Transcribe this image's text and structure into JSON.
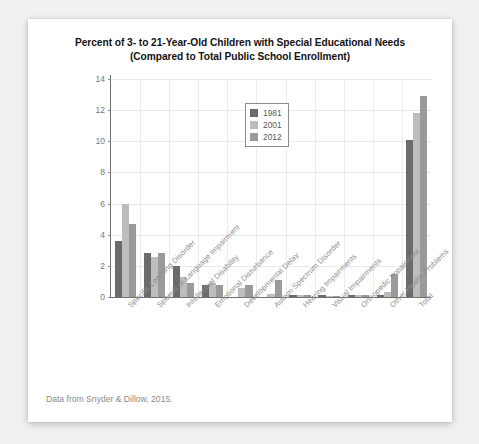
{
  "card": {
    "title_line1": "Percent of 3- to 21-Year-Old Children with Special Educational Needs",
    "title_line2": "(Compared to Total Public School Enrollment)",
    "caption": "Data from Snyder & Dillow, 2015."
  },
  "legend": {
    "items": [
      {
        "label": "1981",
        "color": "#6b6b6b"
      },
      {
        "label": "2001",
        "color": "#bdbdbd"
      },
      {
        "label": "2012",
        "color": "#9a9a9a"
      }
    ]
  },
  "chart_data": {
    "type": "bar",
    "title": "Percent of 3- to 21-Year-Old Children with Special Educational Needs (Compared to Total Public School Enrollment)",
    "xlabel": "",
    "ylabel": "",
    "ylim": [
      0,
      14
    ],
    "yticks": [
      0,
      2,
      4,
      6,
      8,
      10,
      12,
      14
    ],
    "ytick_labels": [
      "0",
      "2",
      "4",
      "6",
      "8",
      "10",
      "12",
      "14"
    ],
    "grid": true,
    "legend_position": "upper center",
    "source": "Data from Snyder & Dillow, 2015.",
    "categories": [
      "Specific Learning Disorder",
      "Speech or Language Impairment",
      "Intellectual Disability",
      "Emotional Disturbance",
      "Developmental Delay",
      "Autism Spectrum Disorder",
      "Hearing Impairments",
      "Visual Impairments",
      "Orthopedic Impairment",
      "Other Health Problems",
      "Total"
    ],
    "series": [
      {
        "name": "1981",
        "color": "#6b6b6b",
        "values": [
          3.6,
          2.8,
          2.0,
          0.8,
          0.0,
          0.0,
          0.1,
          0.1,
          0.1,
          0.1,
          10.1
        ]
      },
      {
        "name": "2001",
        "color": "#bdbdbd",
        "values": [
          6.0,
          2.6,
          1.3,
          0.9,
          0.6,
          0.2,
          0.15,
          0.05,
          0.15,
          0.3,
          11.8
        ]
      },
      {
        "name": "2012",
        "color": "#9a9a9a",
        "values": [
          4.7,
          2.8,
          0.9,
          0.8,
          0.8,
          1.1,
          0.15,
          0.05,
          0.12,
          1.5,
          12.9
        ]
      }
    ]
  }
}
